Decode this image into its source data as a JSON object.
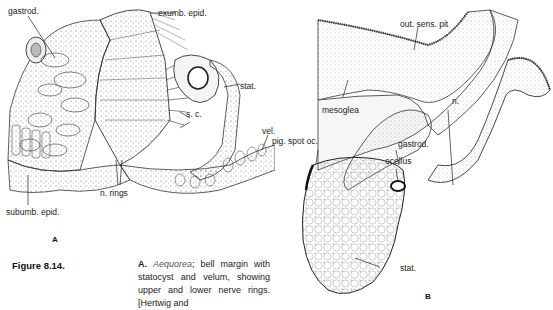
{
  "figure": {
    "number_label": "Figure 8.14.",
    "caption": {
      "part_letter": "A.",
      "species": "Aequorea",
      "text_after_species": "; bell margin with statocyst and velum, showing upper and lower nerve rings. [Hertwig and"
    }
  },
  "panel_a": {
    "letter": "A",
    "labels": {
      "gastrod": "gastrod.",
      "exumb_epid": "exumb. epid.",
      "stat": "stat.",
      "sc": "s. c.",
      "vel": "vel.",
      "n_rings": "n. rings",
      "subumb_epid": "subumb. epid."
    }
  },
  "panel_b": {
    "letter": "B",
    "labels": {
      "out_sens_pit": "out. sens. pit",
      "mesoglea": "mesoglea",
      "pig_spot_oc": "pig. spot oc.",
      "gastrod": "gastrod.",
      "n": "n.",
      "ocellus": "ocellus",
      "stat": "stat."
    }
  }
}
